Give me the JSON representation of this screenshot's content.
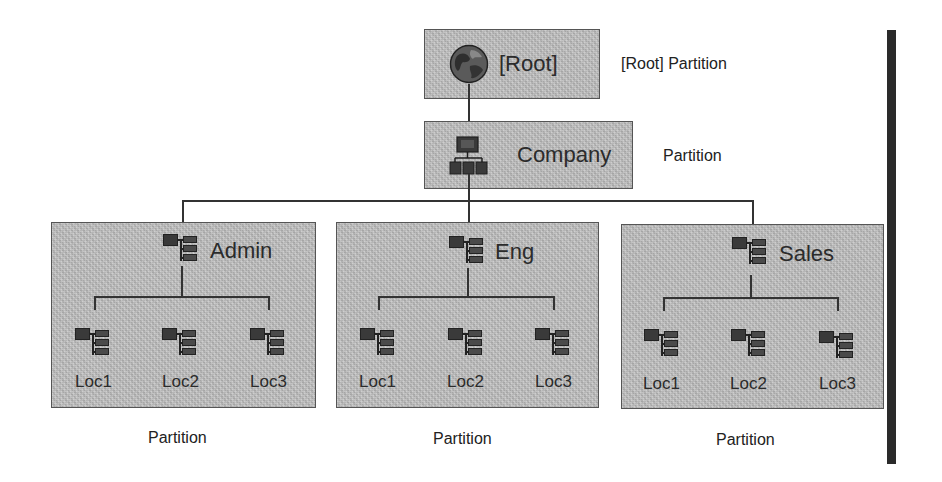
{
  "diagram": {
    "root": {
      "label": "[Root]",
      "side_label": "[Root] Partition",
      "icon": "globe-icon"
    },
    "company": {
      "label": "Company",
      "side_label": "Partition",
      "icon": "org-chart-icon"
    },
    "containers": [
      {
        "label": "Admin",
        "partition_label": "Partition",
        "icon": "tree-node-icon",
        "children": [
          {
            "label": "Loc1",
            "icon": "tree-node-icon"
          },
          {
            "label": "Loc2",
            "icon": "tree-node-icon"
          },
          {
            "label": "Loc3",
            "icon": "tree-node-icon"
          }
        ]
      },
      {
        "label": "Eng",
        "partition_label": "Partition",
        "icon": "tree-node-icon",
        "children": [
          {
            "label": "Loc1",
            "icon": "tree-node-icon"
          },
          {
            "label": "Loc2",
            "icon": "tree-node-icon"
          },
          {
            "label": "Loc3",
            "icon": "tree-node-icon"
          }
        ]
      },
      {
        "label": "Sales",
        "partition_label": "Partition",
        "icon": "tree-node-icon",
        "children": [
          {
            "label": "Loc1",
            "icon": "tree-node-icon"
          },
          {
            "label": "Loc2",
            "icon": "tree-node-icon"
          },
          {
            "label": "Loc3",
            "icon": "tree-node-icon"
          }
        ]
      }
    ],
    "colors": {
      "box_fill": "#bcbcbc",
      "box_border": "#555555",
      "line": "#333333",
      "side_bar": "#2a2a2a",
      "background": "#ffffff"
    }
  }
}
